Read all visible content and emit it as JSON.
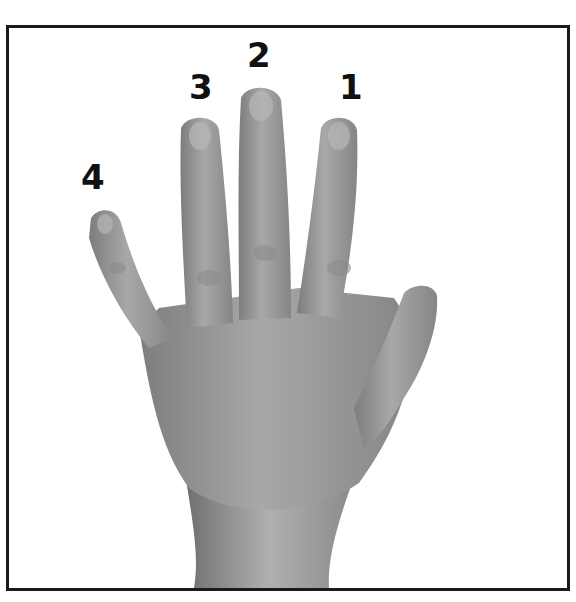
{
  "figure": {
    "border_color": "#1a1a1a",
    "finger_labels": [
      {
        "id": "index",
        "text": "1"
      },
      {
        "id": "middle",
        "text": "2"
      },
      {
        "id": "ring",
        "text": "3"
      },
      {
        "id": "pinky",
        "text": "4"
      }
    ]
  }
}
